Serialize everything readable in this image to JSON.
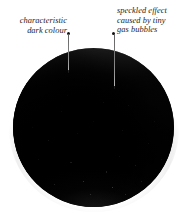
{
  "figure": {
    "background_color": "#ffffff",
    "sphere": {
      "body_color": "#050505",
      "highlight_color": "#e8e8e8",
      "glow_color": "#ececec"
    }
  },
  "annotations": [
    {
      "id": "dark-colour",
      "lines": [
        "characteristic",
        "dark colour"
      ],
      "align": "right",
      "dot_color": "#121212"
    },
    {
      "id": "speckled",
      "lines": [
        "speckled effect",
        "caused by tiny",
        "gas bubbles"
      ],
      "align": "left",
      "dot_color": "#121212"
    }
  ]
}
